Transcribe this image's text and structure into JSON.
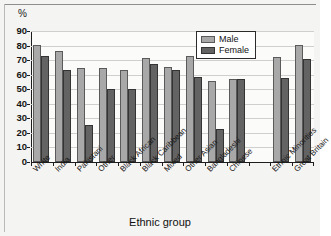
{
  "figure": {
    "unit_label": "%",
    "x_axis_title": "Ethnic group"
  },
  "legend": {
    "position": "top-right",
    "entries": [
      {
        "name": "male-series",
        "label": "Male",
        "color": "#a8a8a8"
      },
      {
        "name": "female-series",
        "label": "Female",
        "color": "#636363"
      }
    ]
  },
  "axes": {
    "y_ticks": [
      "0",
      "10",
      "20",
      "30",
      "40",
      "50",
      "60",
      "70",
      "80",
      "90"
    ],
    "y_min": 0,
    "y_max": 90,
    "x_tick_labels": [
      "White",
      "India",
      "Pakistani",
      "Other",
      "Black African",
      "Black Caribbean",
      "Mixed",
      "Other Asian",
      "Bangladeshi",
      "Chinese",
      "",
      "Ethnic Minorities",
      "Great Britain"
    ]
  },
  "chart_data": {
    "type": "bar",
    "title": "",
    "subtitle": "",
    "xlabel": "Ethnic group",
    "ylabel": "%",
    "ylim": [
      0,
      90
    ],
    "grid": true,
    "legend_position": "top-right",
    "categories": [
      "White",
      "India",
      "Pakistani",
      "Other",
      "Black African",
      "Black Caribbean",
      "Mixed",
      "Other Asian",
      "Bangladeshi",
      "Chinese",
      "",
      "Ethnic Minorities",
      "Great Britain"
    ],
    "series": [
      {
        "name": "Male",
        "color": "#a8a8a8",
        "values": [
          80.5,
          76.5,
          64.5,
          64.5,
          63.5,
          71.5,
          65.5,
          72.5,
          56.0,
          57.0,
          null,
          72.0,
          80.5
        ]
      },
      {
        "name": "Female",
        "color": "#636363",
        "values": [
          72.5,
          63.0,
          25.5,
          50.0,
          50.5,
          67.5,
          63.5,
          58.5,
          22.5,
          57.0,
          null,
          58.0,
          71.0
        ]
      }
    ]
  }
}
